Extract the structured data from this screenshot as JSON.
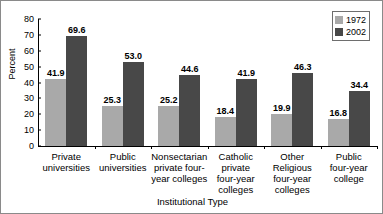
{
  "chart_data": {
    "type": "bar",
    "title": "",
    "xlabel": "Institutional Type",
    "ylabel": "Percent",
    "ylim": [
      0,
      80
    ],
    "ytick_values": [
      0,
      10,
      20,
      30,
      40,
      50,
      60,
      70,
      80
    ],
    "ytick_labels": [
      "0",
      "10",
      "20",
      "30",
      "40",
      "50",
      "60",
      "70",
      "80"
    ],
    "grid": false,
    "legend_position": "top-right",
    "categories": [
      "Private universities",
      "Public universities",
      "Nonsectarian private four-year colleges",
      "Catholic private four-year colleges",
      "Other Religious four-year colleges",
      "Public four-year college"
    ],
    "category_lines": [
      [
        "Private",
        "universities"
      ],
      [
        "Public",
        "universities"
      ],
      [
        "Nonsectarian",
        "private four-",
        "year colleges"
      ],
      [
        "Catholic",
        "private",
        "four-year",
        "colleges"
      ],
      [
        "Other",
        "Religious",
        "four-year",
        "colleges"
      ],
      [
        "Public",
        "four-year",
        "college"
      ]
    ],
    "series": [
      {
        "name": "1972",
        "color": "#a9a9a9",
        "values": [
          41.9,
          25.3,
          25.2,
          18.4,
          19.9,
          16.8
        ],
        "labels": [
          "41.9",
          "25.3",
          "25.2",
          "18.4",
          "19.9",
          "16.8"
        ]
      },
      {
        "name": "2002",
        "color": "#484848",
        "values": [
          69.6,
          53.0,
          44.6,
          41.9,
          46.3,
          34.4
        ],
        "labels": [
          "69.6",
          "53.0",
          "44.6",
          "41.9",
          "46.3",
          "34.4"
        ]
      }
    ]
  }
}
